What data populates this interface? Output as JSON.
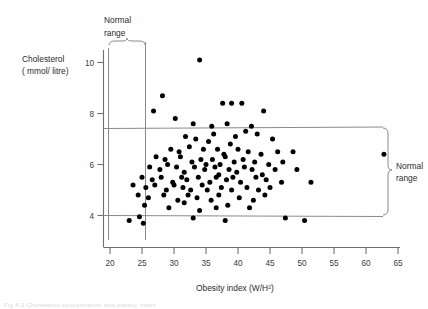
{
  "figure": {
    "background": "#ffffff",
    "point_color": "#000000",
    "axis_color": "#6f6f6f",
    "caption": "Fig 4.3 Cholesterol concentration and obesity index"
  },
  "annotations": {
    "top_normal_range": "Normal\nrange",
    "top_normal_range_line1": "Normal",
    "top_normal_range_line2": "range",
    "right_normal_range_line1": "Normal",
    "right_normal_range_line2": "range"
  },
  "chart_data": {
    "type": "scatter",
    "title": "",
    "xlabel": "Obesity index (W/H²)",
    "ylabel_line1": "Cholesterol",
    "ylabel_line2": "( mmol/ litre)",
    "xlim": [
      20,
      65
    ],
    "ylim": [
      2.7,
      11.0
    ],
    "xticks": [
      20,
      25,
      30,
      35,
      40,
      45,
      50,
      55,
      60,
      65
    ],
    "xtick_labels": [
      "20",
      "25",
      "30",
      "35",
      "40",
      "45",
      "50",
      "55",
      "60",
      "65"
    ],
    "yticks": [
      4,
      6,
      8,
      10
    ],
    "ytick_labels": [
      "4",
      "6",
      "8",
      "10"
    ],
    "grid": false,
    "legend": "none",
    "reference_bands": {
      "x_normal_range": [
        23.2,
        25.0
      ],
      "y_normal_range": [
        4.0,
        7.4
      ]
    },
    "points": [
      [
        34.0,
        10.1
      ],
      [
        28.2,
        8.7
      ],
      [
        26.8,
        8.1
      ],
      [
        37.6,
        8.4
      ],
      [
        39.0,
        8.4
      ],
      [
        40.6,
        8.4
      ],
      [
        30.2,
        7.8
      ],
      [
        33.0,
        7.6
      ],
      [
        35.9,
        7.5
      ],
      [
        38.3,
        7.6
      ],
      [
        42.1,
        7.5
      ],
      [
        44.0,
        8.1
      ],
      [
        31.8,
        7.1
      ],
      [
        33.4,
        7.0
      ],
      [
        36.2,
        7.2
      ],
      [
        39.6,
        7.1
      ],
      [
        41.2,
        7.3
      ],
      [
        43.0,
        7.2
      ],
      [
        45.4,
        7.0
      ],
      [
        29.5,
        6.6
      ],
      [
        30.8,
        6.5
      ],
      [
        32.4,
        6.7
      ],
      [
        34.6,
        6.6
      ],
      [
        35.4,
        6.9
      ],
      [
        36.8,
        6.6
      ],
      [
        37.8,
        6.4
      ],
      [
        38.8,
        6.8
      ],
      [
        40.0,
        6.6
      ],
      [
        41.6,
        6.5
      ],
      [
        43.6,
        6.4
      ],
      [
        46.2,
        6.5
      ],
      [
        48.6,
        6.5
      ],
      [
        62.8,
        6.4
      ],
      [
        27.2,
        6.3
      ],
      [
        28.6,
        6.2
      ],
      [
        31.0,
        6.3
      ],
      [
        32.8,
        6.1
      ],
      [
        34.2,
        6.2
      ],
      [
        35.0,
        6.0
      ],
      [
        36.0,
        6.2
      ],
      [
        37.2,
        6.0
      ],
      [
        38.0,
        6.3
      ],
      [
        39.4,
        6.1
      ],
      [
        40.8,
        6.2
      ],
      [
        42.6,
        6.1
      ],
      [
        44.8,
        6.0
      ],
      [
        47.0,
        6.1
      ],
      [
        26.2,
        5.9
      ],
      [
        27.8,
        5.8
      ],
      [
        29.0,
        6.0
      ],
      [
        30.4,
        5.9
      ],
      [
        31.6,
        5.7
      ],
      [
        33.2,
        5.9
      ],
      [
        34.8,
        5.8
      ],
      [
        36.4,
        5.9
      ],
      [
        37.0,
        5.6
      ],
      [
        38.6,
        5.8
      ],
      [
        39.8,
        5.7
      ],
      [
        41.0,
        5.9
      ],
      [
        42.2,
        5.8
      ],
      [
        43.8,
        5.6
      ],
      [
        45.8,
        5.8
      ],
      [
        49.2,
        5.8
      ],
      [
        25.0,
        5.5
      ],
      [
        26.6,
        5.4
      ],
      [
        28.0,
        5.5
      ],
      [
        29.8,
        5.3
      ],
      [
        31.2,
        5.5
      ],
      [
        32.0,
        5.4
      ],
      [
        33.8,
        5.5
      ],
      [
        35.6,
        5.3
      ],
      [
        36.6,
        5.5
      ],
      [
        38.2,
        5.4
      ],
      [
        39.2,
        5.5
      ],
      [
        40.4,
        5.3
      ],
      [
        42.8,
        5.5
      ],
      [
        44.4,
        5.4
      ],
      [
        46.8,
        5.3
      ],
      [
        51.4,
        5.3
      ],
      [
        23.6,
        5.2
      ],
      [
        25.6,
        5.1
      ],
      [
        27.0,
        5.2
      ],
      [
        28.8,
        5.0
      ],
      [
        30.0,
        5.2
      ],
      [
        31.4,
        5.1
      ],
      [
        32.6,
        5.0
      ],
      [
        34.4,
        5.2
      ],
      [
        35.2,
        5.0
      ],
      [
        37.4,
        5.1
      ],
      [
        39.0,
        5.0
      ],
      [
        41.4,
        5.1
      ],
      [
        43.2,
        5.0
      ],
      [
        45.0,
        5.1
      ],
      [
        24.4,
        4.8
      ],
      [
        26.0,
        4.7
      ],
      [
        28.4,
        4.8
      ],
      [
        30.6,
        4.6
      ],
      [
        32.2,
        4.8
      ],
      [
        33.6,
        4.7
      ],
      [
        35.8,
        4.6
      ],
      [
        37.0,
        4.8
      ],
      [
        40.2,
        4.7
      ],
      [
        42.4,
        4.6
      ],
      [
        44.2,
        4.8
      ],
      [
        25.4,
        4.4
      ],
      [
        29.2,
        4.3
      ],
      [
        31.6,
        4.5
      ],
      [
        34.0,
        4.2
      ],
      [
        36.6,
        4.3
      ],
      [
        38.4,
        4.4
      ],
      [
        41.8,
        4.3
      ],
      [
        23.0,
        3.8
      ],
      [
        33.0,
        3.9
      ],
      [
        38.0,
        3.8
      ],
      [
        47.4,
        3.9
      ],
      [
        50.4,
        3.8
      ],
      [
        24.6,
        3.95
      ],
      [
        25.2,
        3.7
      ]
    ]
  }
}
